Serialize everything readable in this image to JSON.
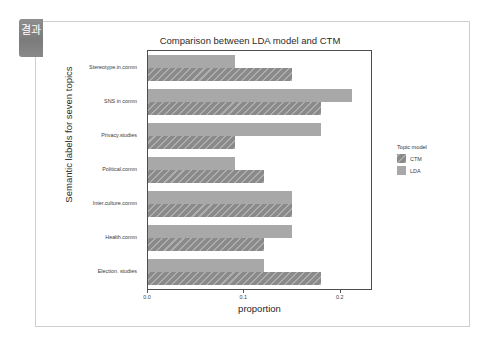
{
  "slide": {
    "corner_tab_label": "결과"
  },
  "chart_data": {
    "type": "bar",
    "orientation": "horizontal",
    "title": "Comparison between LDA model and CTM",
    "xlabel": "proportion",
    "ylabel": "Semantic labels for seven topics",
    "categories": [
      "Stereotype.in.comm",
      "SNS in comm",
      "Privacy.studies",
      "Political.comm",
      "Inter.culture.comm",
      "Health.comm",
      "Election. studies"
    ],
    "series": [
      {
        "name": "LDA",
        "color": "#a8a8a8",
        "values": [
          0.09,
          0.212,
          0.18,
          0.09,
          0.15,
          0.15,
          0.12
        ]
      },
      {
        "name": "CTM",
        "color": "#8a8a8a",
        "values": [
          0.15,
          0.18,
          0.09,
          0.12,
          0.15,
          0.12,
          0.18
        ]
      }
    ],
    "xlim": [
      0.0,
      0.2315
    ],
    "xticks": [
      0.0,
      0.1,
      0.2
    ],
    "xtick_labels": [
      "0.0",
      "0.1",
      "0.2"
    ],
    "grid": false,
    "legend": {
      "title": "Topic model",
      "position": "right",
      "entries": [
        {
          "label": "CTM",
          "color": "#8a8a8a",
          "hatched": true
        },
        {
          "label": "LDA",
          "color": "#a8a8a8",
          "hatched": false
        }
      ]
    }
  }
}
